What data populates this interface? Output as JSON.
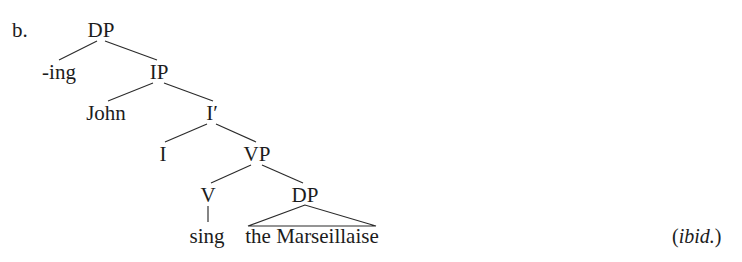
{
  "figure": {
    "item_label": "b.",
    "citation_open": "(",
    "citation_source": "ibid.",
    "citation_close": ")",
    "ink_color": "#1c1c1c",
    "line_color": "#2a2a2a",
    "background_color": "#ffffff"
  },
  "tree": {
    "nodes": {
      "dp_top": "DP",
      "ing": "-ing",
      "ip": "IP",
      "john": "John",
      "ibar": "I′",
      "i": "I",
      "vp": "VP",
      "v": "V",
      "dp_obj": "DP",
      "sing": "sing",
      "marseillaise": "the Marseillaise"
    }
  }
}
